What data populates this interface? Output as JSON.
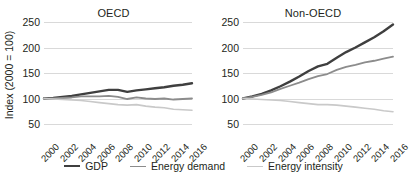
{
  "chart_data": {
    "type": "line",
    "title": "",
    "panels": [
      {
        "title": "OECD",
        "x": [
          2000,
          2001,
          2002,
          2003,
          2004,
          2005,
          2006,
          2007,
          2008,
          2009,
          2010,
          2011,
          2012,
          2013,
          2014,
          2015,
          2016
        ],
        "series": [
          {
            "name": "GDP",
            "color": "#3f3f3f",
            "values": [
              100,
              101,
              103,
              105,
              108,
              111,
              114,
              117,
              117,
              113,
              116,
              118,
              120,
              122,
              125,
              127,
              130
            ]
          },
          {
            "name": "Energy demand",
            "color": "#8c8c8c",
            "values": [
              100,
              100,
              101,
              102,
              104,
              104,
              104,
              105,
              103,
              99,
              102,
              100,
              99,
              100,
              98,
              99,
              100
            ]
          },
          {
            "name": "Energy intensity",
            "color": "#c9c9c9",
            "values": [
              100,
              99,
              98,
              97,
              96,
              94,
              92,
              90,
              88,
              87,
              88,
              85,
              83,
              82,
              79,
              78,
              77
            ]
          }
        ]
      },
      {
        "title": "Non-OECD",
        "x": [
          2000,
          2001,
          2002,
          2003,
          2004,
          2005,
          2006,
          2007,
          2008,
          2009,
          2010,
          2011,
          2012,
          2013,
          2014,
          2015,
          2016
        ],
        "series": [
          {
            "name": "GDP",
            "color": "#3f3f3f",
            "values": [
              100,
              104,
              109,
              116,
              124,
              133,
              143,
              154,
              163,
              168,
              180,
              191,
              200,
              210,
              220,
              232,
              245
            ]
          },
          {
            "name": "Energy demand",
            "color": "#8c8c8c",
            "values": [
              100,
              103,
              107,
              112,
              119,
              125,
              131,
              138,
              144,
              148,
              156,
              162,
              166,
              171,
              174,
              178,
              182
            ]
          },
          {
            "name": "Energy intensity",
            "color": "#c9c9c9",
            "values": [
              100,
              99,
              98,
              97,
              96,
              94,
              92,
              90,
              88,
              88,
              87,
              85,
              83,
              81,
              79,
              76,
              74
            ]
          }
        ]
      }
    ],
    "ylabel": "Index (2000 = 100)",
    "xlabel": "",
    "ylim": [
      50,
      250
    ],
    "yticks": [
      50,
      100,
      150,
      200,
      250
    ],
    "xticks": [
      2000,
      2002,
      2004,
      2006,
      2008,
      2010,
      2012,
      2014,
      2016
    ],
    "xlim": [
      2000,
      2016
    ],
    "grid": "horizontal",
    "legend_position": "bottom",
    "legend": [
      {
        "label": "GDP",
        "color": "#3f3f3f",
        "width": 2.4
      },
      {
        "label": "Energy demand",
        "color": "#8c8c8c",
        "width": 1.8
      },
      {
        "label": "Energy intensity",
        "color": "#c9c9c9",
        "width": 1.6
      }
    ]
  }
}
